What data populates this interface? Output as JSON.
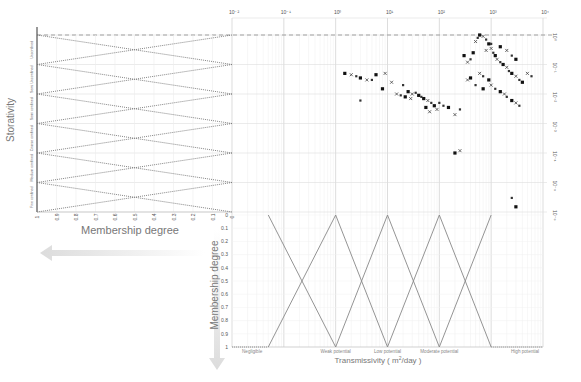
{
  "chart_data": [
    {
      "type": "scatter",
      "title": "",
      "xlabel": "Transmissivity ( m²/day )",
      "ylabel": "Storativity",
      "xscale": "log",
      "yscale": "log",
      "xlim": [
        0.01,
        10000
      ],
      "ylim": [
        1e-06,
        1
      ],
      "x_tick_labels": [
        "10⁻²",
        "10⁻¹",
        "10⁰",
        "10¹",
        "10²",
        "10³",
        "10⁴"
      ],
      "y_tick_labels": [
        "10⁰",
        "10⁻¹",
        "10⁻²",
        "10⁻³",
        "10⁻⁴",
        "10⁻⁵",
        "10⁻⁶"
      ],
      "grid": true,
      "reference_line": {
        "style": "dashed",
        "y": 1
      },
      "series": [
        {
          "name": "observations",
          "marker": "mixed (square, cross, triangle)",
          "points": [
            [
              1.5,
              0.05
            ],
            [
              2,
              0.045
            ],
            [
              2.5,
              0.04
            ],
            [
              3,
              0.035
            ],
            [
              4,
              0.03
            ],
            [
              5,
              0.03
            ],
            [
              6,
              0.045
            ],
            [
              9,
              0.05
            ],
            [
              3,
              0.006
            ],
            [
              8,
              0.015
            ],
            [
              12,
              0.025
            ],
            [
              20,
              0.02
            ],
            [
              25,
              0.012
            ],
            [
              30,
              0.01
            ],
            [
              35,
              0.011
            ],
            [
              40,
              0.009
            ],
            [
              15,
              0.01
            ],
            [
              18,
              0.009
            ],
            [
              22,
              0.008
            ],
            [
              28,
              0.007
            ],
            [
              45,
              0.008
            ],
            [
              50,
              0.007
            ],
            [
              60,
              0.006
            ],
            [
              70,
              0.005
            ],
            [
              80,
              0.004
            ],
            [
              90,
              0.003
            ],
            [
              100,
              0.005
            ],
            [
              55,
              0.0035
            ],
            [
              65,
              0.0025
            ],
            [
              120,
              0.004
            ],
            [
              150,
              0.0035
            ],
            [
              200,
              0.002
            ],
            [
              250,
              0.003
            ],
            [
              300,
              0.2
            ],
            [
              350,
              0.12
            ],
            [
              400,
              0.15
            ],
            [
              450,
              0.25
            ],
            [
              500,
              0.6
            ],
            [
              550,
              0.8
            ],
            [
              600,
              1.0
            ],
            [
              700,
              0.9
            ],
            [
              800,
              0.7
            ],
            [
              900,
              0.5
            ],
            [
              1000,
              0.35
            ],
            [
              1100,
              0.25
            ],
            [
              1200,
              0.2
            ],
            [
              1300,
              0.15
            ],
            [
              1500,
              0.12
            ],
            [
              1700,
              0.1
            ],
            [
              2000,
              0.08
            ],
            [
              2200,
              0.06
            ],
            [
              2500,
              0.05
            ],
            [
              3000,
              0.04
            ],
            [
              3500,
              0.03
            ],
            [
              4000,
              0.025
            ],
            [
              600,
              0.05
            ],
            [
              700,
              0.04
            ],
            [
              900,
              0.03
            ],
            [
              1000,
              0.02
            ],
            [
              1200,
              0.015
            ],
            [
              1500,
              0.012
            ],
            [
              1800,
              0.01
            ],
            [
              2000,
              0.008
            ],
            [
              2500,
              0.006
            ],
            [
              3000,
              0.005
            ],
            [
              3500,
              0.004
            ],
            [
              400,
              0.035
            ],
            [
              350,
              0.03
            ],
            [
              500,
              0.02
            ],
            [
              700,
              0.015
            ],
            [
              800,
              0.3
            ],
            [
              1000,
              0.5
            ],
            [
              1500,
              0.4
            ],
            [
              2000,
              0.3
            ],
            [
              2500,
              0.2
            ],
            [
              3000,
              0.15
            ],
            [
              5000,
              0.05
            ],
            [
              6000,
              0.04
            ],
            [
              200,
              0.0001
            ],
            [
              250,
              0.00012
            ],
            [
              2500,
              3e-06
            ],
            [
              3000,
              1.5e-06
            ]
          ]
        }
      ]
    },
    {
      "type": "line",
      "title": "Storativity membership functions",
      "xlabel": "Membership degree",
      "ylabel": "Storativity",
      "x_tick_labels": [
        "1",
        "0.9",
        "0.8",
        "0.7",
        "0.6",
        "0.5",
        "0.4",
        "0.3",
        "0.2",
        "0.1",
        "0"
      ],
      "classes": [
        "Unconfined",
        "Semi Unconfined",
        "Semi confined",
        "Coarse confined",
        "Medium confined",
        "Fine confined"
      ],
      "shape": "triangular, overlapping at 0.5",
      "line_style": "dotted"
    },
    {
      "type": "line",
      "title": "Transmissivity membership functions",
      "xlabel": "Transmissivity ( m²/day )",
      "ylabel": "Membership degree",
      "y_tick_labels": [
        "0",
        "0.1",
        "0.2",
        "0.3",
        "0.4",
        "0.5",
        "0.6",
        "0.7",
        "0.8",
        "0.9",
        "1"
      ],
      "classes": [
        "Negligible",
        "Weak potential",
        "Low potential",
        "Moderate potential",
        "High potential"
      ],
      "breakpoints_log10T": [
        -1.3,
        0.0,
        1.0,
        2.0,
        3.0
      ],
      "shape": "triangular/trapezoidal, overlapping at 0.5",
      "line_style": "dotted"
    }
  ],
  "labels": {
    "storativity": "Storativity",
    "membership_left": "Membership degree",
    "membership_bottom": "Membership degree",
    "transmissivity": "Transmissivity ( m",
    "transmissivity_sup": "2",
    "transmissivity_unit": "/day )"
  }
}
